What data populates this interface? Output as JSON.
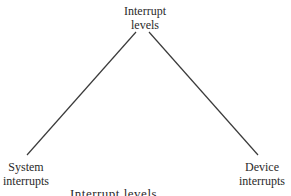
{
  "diagram": {
    "root": {
      "line1": "Interrupt",
      "line2": "levels"
    },
    "children": [
      {
        "line1": "System",
        "line2": "interrupts"
      },
      {
        "line1": "Device",
        "line2": "interrupts"
      }
    ],
    "caption": "Interrupt levels",
    "colors": {
      "line": "#3a3a3a",
      "text": "#2a2a2a",
      "background": "#ffffff"
    }
  }
}
